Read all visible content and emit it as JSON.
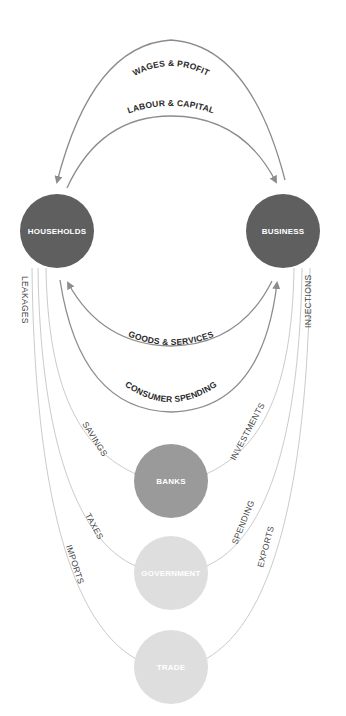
{
  "nodes": {
    "households": {
      "label": "HOUSEHOLDS",
      "color": "#5f5f5f"
    },
    "business": {
      "label": "BUSINESS",
      "color": "#5f5f5f"
    },
    "banks": {
      "label": "BANKS",
      "color": "#9a9a9a"
    },
    "government": {
      "label": "GOVERNMENT",
      "color": "#dedede"
    },
    "trade": {
      "label": "TRADE",
      "color": "#dedede"
    }
  },
  "flows": {
    "wages_profit": "WAGES & PROFIT",
    "labour_capital": "LABOUR & CAPITAL",
    "goods_services": "GOODS & SERVICES",
    "consumer_spending": "CONSUMER SPENDING"
  },
  "sides": {
    "leakages": "LEAKAGES",
    "injections": "INJECTIONS"
  },
  "leakage_items": {
    "savings": "SAVINGS",
    "taxes": "TAXES",
    "imports": "IMPORTS"
  },
  "injection_items": {
    "investments": "INVESTMENTS",
    "spending": "SPENDING",
    "exports": "EXPORTS"
  },
  "colors": {
    "arrow": "#8c8c8c",
    "thin_line": "#c4c4c4",
    "dark_node": "#5f5f5f",
    "mid_node": "#9a9a9a",
    "light_node": "#dedede"
  }
}
